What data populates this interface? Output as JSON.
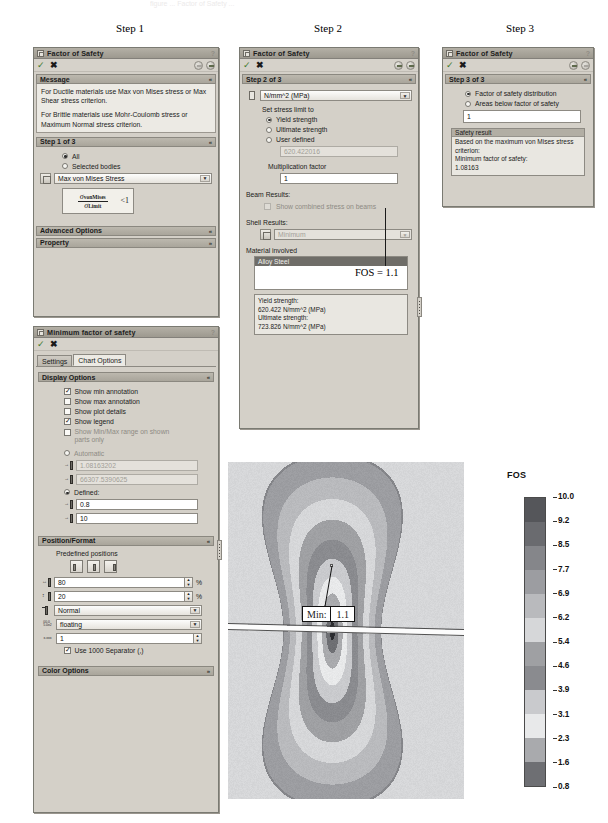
{
  "captions": {
    "step1": "Step 1",
    "step2": "Step 2",
    "step3": "Step 3"
  },
  "ghost_header": "figure ... Factor of Safety ...",
  "panel_step1": {
    "title": "Factor of Safety",
    "help": "?",
    "toolbar": {
      "ok": "✓",
      "cancel": "✖",
      "back_icon": "back-arrow-icon",
      "next_icon": "next-arrow-icon"
    },
    "message_section": {
      "label": "Message",
      "chev": "«"
    },
    "message_paragraph_1": "For Ductile materials use Max von Mises stress or Max Shear stress criterion.",
    "message_paragraph_2": "For Brittle materials use Mohr-Coulomb stress or Maximum Normal stress criterion.",
    "step_section": {
      "label": "Step 1 of 3",
      "chev": "«"
    },
    "option_all": "All",
    "option_selected_bodies": "Selected bodies",
    "criterion_combo": "Max von Mises Stress",
    "equation": {
      "numerator_symbol": "σ",
      "numerator_sub": "vonMises",
      "denominator_symbol": "σ",
      "denominator_sub": "Limit",
      "comparison": "<1"
    },
    "advanced_options": {
      "label": "Advanced Options",
      "chev": "«"
    },
    "property": {
      "label": "Property",
      "chev": "»"
    }
  },
  "panel_step2": {
    "title": "Factor of Safety",
    "help": "?",
    "toolbar": {
      "ok": "✓",
      "cancel": "✖"
    },
    "step_section": {
      "label": "Step 2 of 3",
      "chev": "«"
    },
    "units_combo": "N/mm^2 (MPa)",
    "set_stress_limit_label": "Set stress limit to",
    "option_yield": "Yield strength",
    "option_ultimate": "Ultimate strength",
    "option_user_defined": "User defined",
    "user_defined_value": "620.422016",
    "multiplication_factor_label": "Multiplication factor",
    "multiplication_factor_value": "1",
    "beam_results_label": "Beam Results:",
    "beam_results_checkbox": "Show combined stress on beams",
    "shell_results_label": "Shell Results:",
    "shell_results_combo": "Minimum",
    "material_involved_label": "Material involved",
    "material_list": [
      "Alloy Steel"
    ],
    "material_props": [
      "Yield strength:",
      "620.422 N/mm^2 (MPa)",
      "Ultimate strength:",
      "723.826 N/mm^2 (MPa)"
    ]
  },
  "panel_step3": {
    "title": "Factor of Safety",
    "help": "?",
    "toolbar": {
      "ok": "✓",
      "cancel": "✖"
    },
    "step_section": {
      "label": "Step 3 of 3",
      "chev": "«"
    },
    "option_fos_distribution": "Factor of safety distribution",
    "option_areas_below": "Areas below factor of safety",
    "areas_below_value": "1",
    "safety_result_header": "Safety result",
    "safety_result_lines": [
      "Based on the maximum von Mises stress",
      "criterion:",
      "Minimum factor of safety:",
      "1.08163"
    ]
  },
  "fos_annotation": "FOS = 1.1",
  "panel_minfos": {
    "title": "Minimum factor of safety",
    "help": "?",
    "toolbar": {
      "ok": "✓",
      "cancel": "✖"
    },
    "tabs": [
      {
        "label": "Settings",
        "active": false
      },
      {
        "label": "Chart Options",
        "active": true
      }
    ],
    "display_options": {
      "label": "Display Options",
      "chev": "«"
    },
    "checks": [
      {
        "label": "Show min annotation",
        "checked": true
      },
      {
        "label": "Show max annotation",
        "checked": false
      },
      {
        "label": "Show plot details",
        "checked": false
      },
      {
        "label": "Show legend",
        "checked": true
      },
      {
        "label": "Show Min/Max range on shown parts only",
        "checked": false
      }
    ],
    "option_automatic": "Automatic",
    "auto_min_value": "1.08163202",
    "auto_max_value": "66307.5390625",
    "option_defined": "Defined:",
    "defined_min_value": "0.8",
    "defined_max_value": "10",
    "position_format": {
      "label": "Position/Format",
      "chev": "«"
    },
    "predefined_positions_label": "Predefined positions",
    "pos_x_value": "80",
    "pos_x_unit": "%",
    "pos_y_value": "20",
    "pos_y_unit": "%",
    "size_combo": "Normal",
    "number_format_combo": "floating",
    "decimals_value": "1",
    "use_1000_separator": "Use 1000 Separator (,)",
    "color_options": {
      "label": "Color Options",
      "chev": "»"
    }
  },
  "chart_data": {
    "type": "heatmap",
    "title": "FOS",
    "legend_title": "FOS",
    "legend_position": "right",
    "colormap": "grayscale-banded",
    "vmin": 0.8,
    "vmax": 10.0,
    "tick_labels": [
      "10.0",
      "9.2",
      "8.5",
      "7.7",
      "6.9",
      "6.2",
      "5.4",
      "4.6",
      "3.9",
      "3.1",
      "2.3",
      "1.6",
      "0.8"
    ],
    "band_values": [
      10.0,
      9.2,
      8.5,
      7.7,
      6.9,
      6.2,
      5.4,
      4.6,
      3.9,
      3.1,
      2.3,
      1.6,
      0.8
    ],
    "band_colors": [
      "#55565a",
      "#6a6b6f",
      "#85868a",
      "#9c9da1",
      "#b9babd",
      "#d6d7d9",
      "#9fa0a3",
      "#8a8b8f",
      "#c9cacd",
      "#e8e9ea",
      "#a9aaad",
      "#6e6f73",
      "#2b2c30"
    ],
    "min_annotation": {
      "prefix": "Min:",
      "value": "1.1"
    },
    "xlabel": "",
    "ylabel": "",
    "grid": false
  }
}
